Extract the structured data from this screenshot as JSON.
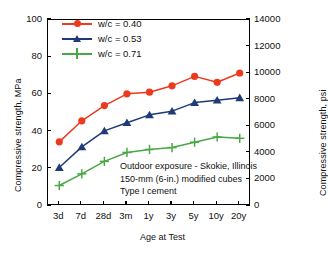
{
  "chart_data": {
    "type": "line",
    "title": "",
    "xlabel": "Age at Test",
    "ylabel": "Compressive strength, MPa",
    "ylabel_right": "Compressive strength, psi",
    "categories": [
      "3d",
      "7d",
      "28d",
      "3m",
      "1y",
      "3y",
      "5y",
      "10y",
      "20y"
    ],
    "ylim": [
      0,
      100
    ],
    "yticks": [
      0,
      20,
      40,
      60,
      80,
      100
    ],
    "ylim_right": [
      0,
      14000
    ],
    "yticks_right": [
      0,
      2000,
      4000,
      6000,
      8000,
      10000,
      12000,
      14000
    ],
    "grid": false,
    "legend_position": "top-left",
    "series": [
      {
        "name": "w/c = 0.40",
        "color": "#ED3A1E",
        "marker": "circle",
        "values": [
          34.5,
          45.8,
          54.0,
          60.3,
          61.2,
          64.6,
          69.7,
          66.5,
          71.5
        ]
      },
      {
        "name": "w/c = 0.53",
        "color": "#1F3A75",
        "marker": "triangle",
        "values": [
          20.7,
          31.8,
          40.4,
          44.8,
          49.0,
          51.0,
          55.6,
          56.9,
          58.2
        ]
      },
      {
        "name": "w/c = 0.71",
        "color": "#49A845",
        "marker": "plus",
        "values": [
          11.0,
          17.3,
          24.0,
          28.8,
          30.4,
          31.4,
          34.3,
          37.1,
          36.4
        ]
      }
    ],
    "annotations": [
      "Outdoor exposure - Skokie, Illinois",
      "150-mm (6-in.) modified cubes",
      "Type I cement"
    ]
  }
}
